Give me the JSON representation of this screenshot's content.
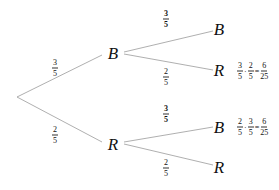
{
  "tree": {
    "first_level": {
      "upper": {
        "node": "B",
        "prob": {
          "num": "3",
          "den": "5"
        }
      },
      "lower": {
        "node": "R",
        "prob": {
          "num": "2",
          "den": "5"
        }
      }
    },
    "second_level": {
      "after_B": {
        "upper": {
          "node": "B",
          "prob": {
            "num": "3",
            "den": "5"
          }
        },
        "lower": {
          "node": "R",
          "prob": {
            "num": "2",
            "den": "5"
          },
          "product": {
            "a": {
              "num": "3",
              "den": "5"
            },
            "op": "·",
            "b": {
              "num": "2",
              "den": "5"
            },
            "eq": "=",
            "result": {
              "num": "6",
              "den": "25"
            }
          }
        }
      },
      "after_R": {
        "upper": {
          "node": "B",
          "prob": {
            "num": "3",
            "den": "5"
          },
          "product": {
            "a": {
              "num": "2",
              "den": "5"
            },
            "op": "·",
            "b": {
              "num": "3",
              "den": "5"
            },
            "eq": "=",
            "result": {
              "num": "6",
              "den": "25"
            }
          }
        },
        "lower": {
          "node": "R",
          "prob": {
            "num": "2",
            "den": "5"
          }
        }
      }
    }
  }
}
